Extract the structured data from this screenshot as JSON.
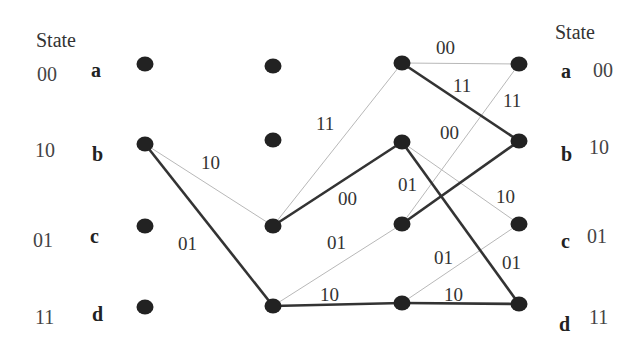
{
  "title_left": "State",
  "title_right": "State",
  "states": [
    {
      "letter": "a",
      "code": "00"
    },
    {
      "letter": "b",
      "code": "10"
    },
    {
      "letter": "c",
      "code": "01"
    },
    {
      "letter": "d",
      "code": "11"
    }
  ],
  "columns_x": [
    145,
    273,
    402,
    519
  ],
  "nodes_y": [
    [
      64,
      144,
      226,
      307
    ],
    [
      66,
      140,
      226,
      306
    ],
    [
      63,
      142,
      224,
      303
    ],
    [
      64,
      141,
      224,
      304
    ]
  ],
  "edges": [
    {
      "from": [
        0,
        "b"
      ],
      "to": [
        1,
        "c"
      ],
      "label": "10",
      "style": "thin"
    },
    {
      "from": [
        0,
        "b"
      ],
      "to": [
        1,
        "d"
      ],
      "label": "01",
      "style": "thick"
    },
    {
      "from": [
        1,
        "c"
      ],
      "to": [
        2,
        "a"
      ],
      "label": "11",
      "style": "thin"
    },
    {
      "from": [
        1,
        "c"
      ],
      "to": [
        2,
        "b"
      ],
      "label": "00",
      "style": "thick"
    },
    {
      "from": [
        1,
        "d"
      ],
      "to": [
        2,
        "c"
      ],
      "label": "01",
      "style": "thin"
    },
    {
      "from": [
        1,
        "d"
      ],
      "to": [
        2,
        "d"
      ],
      "label": "10",
      "style": "thick"
    },
    {
      "from": [
        2,
        "a"
      ],
      "to": [
        3,
        "a"
      ],
      "label": "00",
      "style": "thin"
    },
    {
      "from": [
        2,
        "a"
      ],
      "to": [
        3,
        "b"
      ],
      "label": "11",
      "style": "thick"
    },
    {
      "from": [
        2,
        "b"
      ],
      "to": [
        3,
        "c"
      ],
      "label": "10",
      "style": "thin"
    },
    {
      "from": [
        2,
        "b"
      ],
      "to": [
        3,
        "d"
      ],
      "label": "01",
      "style": "thick"
    },
    {
      "from": [
        2,
        "c"
      ],
      "to": [
        3,
        "a"
      ],
      "label": "11",
      "style": "thin"
    },
    {
      "from": [
        2,
        "c"
      ],
      "to": [
        3,
        "b"
      ],
      "label": "00",
      "style": "thick"
    },
    {
      "from": [
        2,
        "d"
      ],
      "to": [
        3,
        "c"
      ],
      "label": "01",
      "style": "thin"
    },
    {
      "from": [
        2,
        "d"
      ],
      "to": [
        3,
        "d"
      ],
      "label": "10",
      "style": "thick"
    }
  ],
  "edge_labels": [
    {
      "text": "10",
      "x": 201,
      "y": 152
    },
    {
      "text": "01",
      "x": 178,
      "y": 233
    },
    {
      "text": "11",
      "x": 316,
      "y": 113
    },
    {
      "text": "00",
      "x": 338,
      "y": 188
    },
    {
      "text": "01",
      "x": 327,
      "y": 232
    },
    {
      "text": "10",
      "x": 320,
      "y": 284
    },
    {
      "text": "00",
      "x": 436,
      "y": 37
    },
    {
      "text": "11",
      "x": 453,
      "y": 75
    },
    {
      "text": "11",
      "x": 503,
      "y": 90
    },
    {
      "text": "00",
      "x": 440,
      "y": 122
    },
    {
      "text": "01",
      "x": 398,
      "y": 174
    },
    {
      "text": "10",
      "x": 496,
      "y": 186
    },
    {
      "text": "01",
      "x": 434,
      "y": 247
    },
    {
      "text": "01",
      "x": 502,
      "y": 252
    },
    {
      "text": "10",
      "x": 444,
      "y": 284
    }
  ],
  "colors": {
    "node": "#222222",
    "thick_edge": "#333333",
    "thin_edge": "#b8b8b8"
  }
}
